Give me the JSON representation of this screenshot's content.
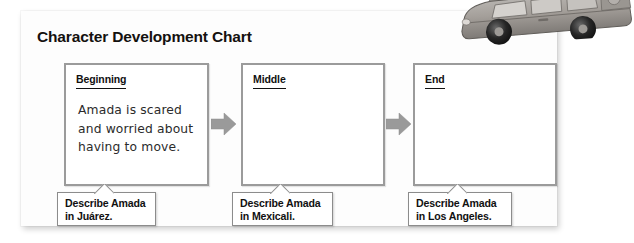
{
  "worksheet": {
    "title": "Character Development Chart",
    "stages": [
      {
        "label": "Beginning",
        "answer": "Amada is scared\nand worried about\nhaving to move.",
        "prompt": "Describe Amada\nin Juárez."
      },
      {
        "label": "Middle",
        "answer": "",
        "prompt": "Describe Amada\nin Mexicali."
      },
      {
        "label": "End",
        "answer": "",
        "prompt": "Describe Amada\nin Los Angeles."
      }
    ]
  },
  "decoration": {
    "car_illustration_name": "loaded-station-wagon-illustration"
  },
  "colors": {
    "page_background": "#ffffff",
    "card_background": "#fdfdfd",
    "box_border": "#9b9b9b",
    "callout_border": "#8c8c8c",
    "arrow_fill": "#9a9a9a",
    "text": "#111111",
    "handwriting": "#2b2b2b"
  }
}
